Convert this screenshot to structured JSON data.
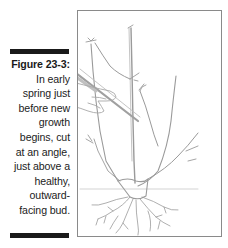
{
  "figure": {
    "label": "Figure 23-3:",
    "caption": "In early\nspring just\nbefore new\ngrowth\nbegins, cut\nat an angle,\njust above a\nhealthy,\noutward-\nfacing bud.",
    "illustration": "rose-bush-pruning-illustration",
    "colors": {
      "bar": "#1a1a1a",
      "frame_border": "#8a8a8a",
      "text": "#222222",
      "drawing": "#9a9a9a"
    }
  }
}
